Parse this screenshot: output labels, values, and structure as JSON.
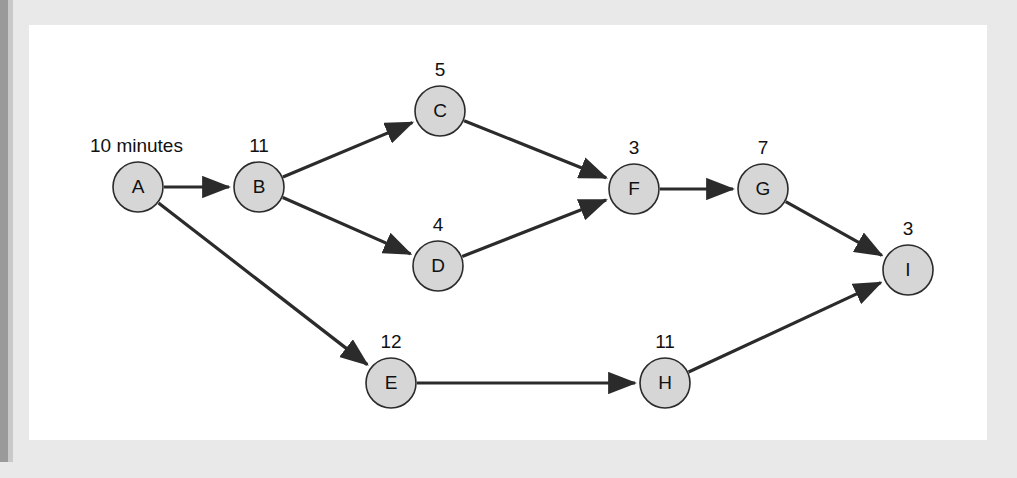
{
  "figure": {
    "kind": "activity-network-diagram",
    "background_color": "#e9e9e9",
    "canvas_color": "#ffffff",
    "node_fill": "#d6d6d6",
    "node_stroke": "#2b2b2b",
    "edge_color": "#2b2b2b"
  },
  "chart_data": {
    "type": "diagram",
    "title": "",
    "xlabel": "",
    "ylabel": "",
    "unit_note": "10 minutes",
    "nodes": [
      {
        "id": "A",
        "label": "A",
        "weight": "10 minutes",
        "weight_is_unit_note": true,
        "cx": 138,
        "cy": 187,
        "r": 25
      },
      {
        "id": "B",
        "label": "B",
        "weight": "11",
        "weight_is_unit_note": false,
        "cx": 259,
        "cy": 187,
        "r": 25
      },
      {
        "id": "C",
        "label": "C",
        "weight": "5",
        "weight_is_unit_note": false,
        "cx": 440,
        "cy": 111,
        "r": 25
      },
      {
        "id": "D",
        "label": "D",
        "weight": "4",
        "weight_is_unit_note": false,
        "cx": 438,
        "cy": 266,
        "r": 25
      },
      {
        "id": "E",
        "label": "E",
        "weight": "12",
        "weight_is_unit_note": false,
        "cx": 391,
        "cy": 383,
        "r": 25
      },
      {
        "id": "F",
        "label": "F",
        "weight": "3",
        "weight_is_unit_note": false,
        "cx": 634,
        "cy": 189,
        "r": 25
      },
      {
        "id": "G",
        "label": "G",
        "weight": "7",
        "weight_is_unit_note": false,
        "cx": 763,
        "cy": 189,
        "r": 25
      },
      {
        "id": "H",
        "label": "H",
        "weight": "11",
        "weight_is_unit_note": false,
        "cx": 665,
        "cy": 383,
        "r": 25
      },
      {
        "id": "I",
        "label": "I",
        "weight": "3",
        "weight_is_unit_note": false,
        "cx": 908,
        "cy": 270,
        "r": 25
      }
    ],
    "edges": [
      {
        "from": "A",
        "to": "B"
      },
      {
        "from": "A",
        "to": "E"
      },
      {
        "from": "B",
        "to": "C"
      },
      {
        "from": "B",
        "to": "D"
      },
      {
        "from": "C",
        "to": "F"
      },
      {
        "from": "D",
        "to": "F"
      },
      {
        "from": "E",
        "to": "H"
      },
      {
        "from": "F",
        "to": "G"
      },
      {
        "from": "G",
        "to": "I"
      },
      {
        "from": "H",
        "to": "I"
      }
    ]
  }
}
